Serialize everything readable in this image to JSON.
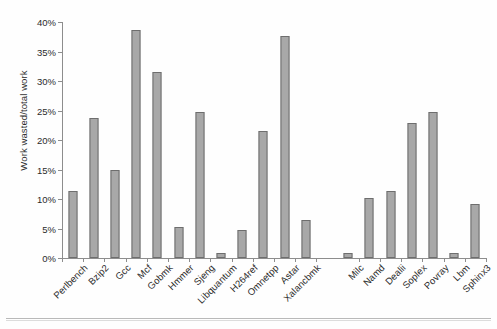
{
  "chart_data": {
    "type": "bar",
    "title": "",
    "xlabel": "",
    "ylabel": "Work wasted/total work",
    "ylim": [
      0,
      40
    ],
    "ytick_labels": [
      "0%",
      "5%",
      "10%",
      "15%",
      "20%",
      "25%",
      "30%",
      "35%",
      "40%"
    ],
    "ytick_values": [
      0,
      5,
      10,
      15,
      20,
      25,
      30,
      35,
      40
    ],
    "grid": false,
    "legend": null,
    "group_gap_after_index": 11,
    "categories": [
      "Perlbench",
      "Bzip2",
      "Gcc",
      "Mcf",
      "Gobmk",
      "Hmmer",
      "Sjeng",
      "Libquantum",
      "H264ref",
      "Omnetpp",
      "Astar",
      "Xalancbmk",
      "Milc",
      "Namd",
      "Dealii",
      "Soplex",
      "Povray",
      "Lbm",
      "Sphinx3"
    ],
    "values": [
      11.3,
      23.7,
      14.9,
      38.6,
      31.5,
      5.3,
      24.7,
      0.9,
      4.7,
      21.6,
      37.7,
      6.4,
      0.9,
      10.2,
      11.4,
      22.9,
      24.7,
      0.8,
      9.1
    ],
    "bar_color": "#a8a8a8",
    "bar_edge_color": "#6e6e6e",
    "axis_color": "#8d8d8d",
    "text_color": "#2b2b2b"
  }
}
